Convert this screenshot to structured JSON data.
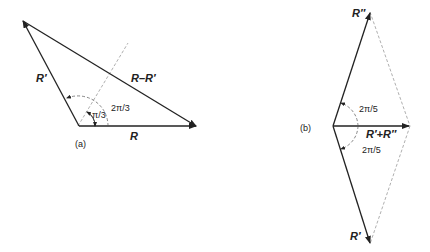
{
  "figure_a": {
    "caption": "(a)",
    "vector_R": "R",
    "vector_R_prime": "R′",
    "vector_diff": "R–R′",
    "angle_outer": "2π/3",
    "angle_inner": "π/3"
  },
  "figure_b": {
    "caption": "(b)",
    "vector_R_double_prime": "R″",
    "vector_R_prime": "R′",
    "vector_sum": "R′+R″",
    "angle_upper": "2π/5",
    "angle_lower": "2π/5"
  },
  "colors": {
    "ink": "#222222",
    "dashed": "#9a9a9a"
  }
}
